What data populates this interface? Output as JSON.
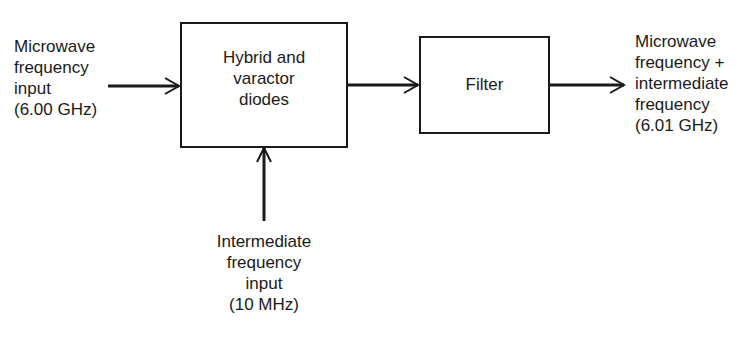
{
  "diagram": {
    "type": "block-diagram",
    "blocks": [
      {
        "id": "mixer",
        "label": "Hybrid and\nvaractor\ndiodes"
      },
      {
        "id": "filter",
        "label": "Filter"
      }
    ],
    "inputs": {
      "microwave": {
        "label": "Microwave\nfrequency\ninput\n(6.00 GHz)"
      },
      "intermediate": {
        "label": "Intermediate\nfrequency\ninput\n(10 MHz)"
      }
    },
    "output": {
      "label": "Microwave\nfrequency +\nintermediate\nfrequency\n(6.01 GHz)"
    },
    "connections": [
      {
        "from": "microwave-input",
        "to": "mixer"
      },
      {
        "from": "intermediate-input",
        "to": "mixer"
      },
      {
        "from": "mixer",
        "to": "filter"
      },
      {
        "from": "filter",
        "to": "output"
      }
    ],
    "colors": {
      "line": "#1a1a1a",
      "background": "#ffffff"
    }
  }
}
